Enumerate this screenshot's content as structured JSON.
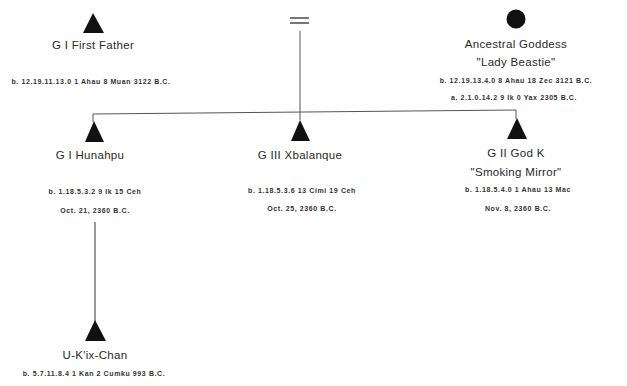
{
  "diagram": {
    "type": "genealogy",
    "colors": {
      "line": "#555555",
      "symbol": "#111111",
      "text": "#2a2a2a"
    },
    "marriage_symbol": "=",
    "parents": [
      {
        "symbol": "triangle",
        "name": "G I  First Father",
        "birth": "b. 12.19.11.13.0   1 Ahau 8 Muan 3122 B.C."
      },
      {
        "symbol": "circle",
        "name": "Ancestral Goddess",
        "epithet": "\"Lady Beastie\"",
        "birth": "b. 12.19.13.4.0   8 Ahau 18 Zec 3121 B.C.",
        "accession": "a. 2.1.0.14.2   9 Ik 0 Yax  2305 B.C."
      }
    ],
    "children": [
      {
        "symbol": "triangle",
        "name": "G I   Hunahpu",
        "birth": "b. 1.18.5.3.2   9 Ik 15 Ceh",
        "date": "Oct. 21, 2360 B.C."
      },
      {
        "symbol": "triangle",
        "name": "G III   Xbalanque",
        "birth": "b. 1.18.5.3.6   13 Cimi 19 Ceh",
        "date": "Oct. 25, 2360 B.C."
      },
      {
        "symbol": "triangle",
        "name": "G II God K",
        "epithet": "\"Smoking Mirror\"",
        "birth": "b. 1.18.5.4.0   1 Ahau 13 Mac",
        "date": "Nov. 8, 2360 B.C."
      }
    ],
    "descendant": {
      "symbol": "triangle",
      "name": "U-K'ix-Chan",
      "birth": "b. 5.7.11.8.4   1 Kan 2 Cumku 993 B.C."
    }
  }
}
